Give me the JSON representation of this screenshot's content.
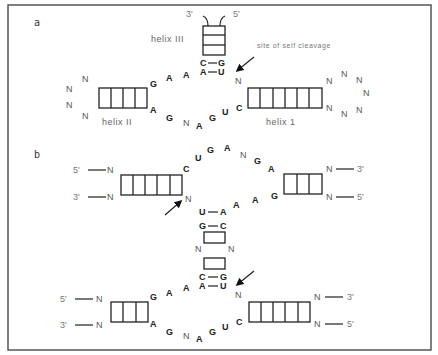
{
  "figure": {
    "panel_a_label": "a",
    "panel_b_label": "b"
  },
  "panel_a": {
    "helix3_label": "helix III",
    "helix2_label": "helix II",
    "helix1_label": "helix 1",
    "cleavage_label": "site of self cleavage",
    "helix3_end_3": "3'",
    "helix3_end_5": "5'",
    "pair_top": [
      "C",
      "G"
    ],
    "pair_bottom": [
      "A",
      "U"
    ],
    "upper_loop": [
      "G",
      "A",
      "A"
    ],
    "lower_loop": [
      "A",
      "G",
      "N",
      "A",
      "G",
      "U",
      "C"
    ],
    "cleavage_n": "N",
    "helix2_loop": [
      "N",
      "N",
      "N",
      "N"
    ],
    "helix1_loop": [
      "N",
      "N",
      "N",
      "N",
      "N",
      "N",
      "N"
    ]
  },
  "panel_b": {
    "top_left": {
      "end5": "5'",
      "end3": "3'",
      "n_top": "N",
      "n_bottom": "N"
    },
    "top_right": {
      "end3": "3'",
      "end5": "5'",
      "n_top": "N",
      "n_bottom": "N"
    },
    "top_loop": [
      "C",
      "U",
      "G",
      "A",
      "N",
      "G",
      "A"
    ],
    "middle_loop": [
      "A",
      "A",
      "G"
    ],
    "cleavage_n_top": "N",
    "stem_pairs_top": [
      [
        "U",
        "A"
      ],
      [
        "G",
        "C"
      ]
    ],
    "stem_n": [
      "N",
      "N"
    ],
    "stem_pairs_bottom": [
      [
        "C",
        "G"
      ],
      [
        "A",
        "U"
      ]
    ],
    "bottom_left": {
      "end5": "5'",
      "end3": "3'",
      "n_top": "N",
      "n_bottom": "N"
    },
    "bottom_right": {
      "end3": "3'",
      "end5": "5'",
      "n_top": "N",
      "n_bottom": "N"
    },
    "bottom_upper_loop": [
      "G",
      "A",
      "A"
    ],
    "bottom_lower_loop": [
      "A",
      "G",
      "N",
      "A",
      "G",
      "U",
      "C"
    ],
    "cleavage_n_bottom": "N"
  }
}
